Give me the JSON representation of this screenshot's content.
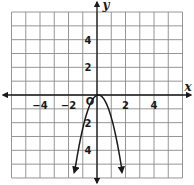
{
  "chart_data": {
    "type": "line",
    "title": "",
    "xlabel": "x",
    "ylabel": "y",
    "xlim": [
      -6,
      6
    ],
    "ylim": [
      -6,
      6
    ],
    "grid": true,
    "grid_step": 1,
    "x_tick_labels": [
      {
        "value": -4,
        "label": "−4"
      },
      {
        "value": -2,
        "label": "−2"
      },
      {
        "value": 2,
        "label": "2"
      },
      {
        "value": 4,
        "label": "4"
      }
    ],
    "y_tick_labels": [
      {
        "value": 4,
        "label": "4"
      },
      {
        "value": 2,
        "label": "2"
      },
      {
        "value": -2,
        "label": "2"
      },
      {
        "value": -4,
        "label": "4"
      }
    ],
    "origin_label": "O",
    "series": [
      {
        "name": "parabola",
        "description": "Downward-opening parabola with vertex near the origin, arrows on both ends",
        "points": [
          {
            "x": -1.6,
            "y": -5.6
          },
          {
            "x": -1.2,
            "y": -3.4
          },
          {
            "x": -0.8,
            "y": -1.6
          },
          {
            "x": -0.4,
            "y": -0.5
          },
          {
            "x": 0.0,
            "y": 0.0
          },
          {
            "x": 0.2,
            "y": 0.0
          },
          {
            "x": 0.6,
            "y": -0.5
          },
          {
            "x": 1.0,
            "y": -1.6
          },
          {
            "x": 1.4,
            "y": -3.4
          },
          {
            "x": 1.75,
            "y": -5.6
          }
        ],
        "end_arrows": true
      }
    ],
    "legend": null
  },
  "colors": {
    "background": "#ffffff",
    "grid": "#8a8a8a",
    "axis": "#1a1a1a",
    "curve": "#1a1a1a"
  }
}
